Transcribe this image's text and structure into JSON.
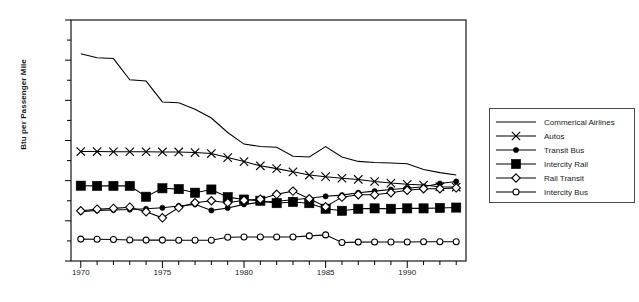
{
  "chart_data": {
    "type": "line",
    "title": "",
    "xlabel": "",
    "ylabel": "Btu per Passenger Mile",
    "xlim": [
      1969.4,
      1993.6
    ],
    "ylim": [
      0,
      12000
    ],
    "grid": false,
    "legend_position": "right",
    "x": [
      1970,
      1971,
      1972,
      1973,
      1974,
      1975,
      1976,
      1977,
      1978,
      1979,
      1980,
      1981,
      1982,
      1983,
      1984,
      1985,
      1986,
      1987,
      1988,
      1989,
      1990,
      1991,
      1992,
      1993
    ],
    "y_ticks": [
      0,
      2000,
      4000,
      6000,
      8000,
      10000,
      12000
    ],
    "y_tick_labels": [
      "0",
      "2,000",
      "4,000",
      "6,000",
      "8,000",
      "10,000",
      "12,000"
    ],
    "y_minor_ticks": [
      1000,
      3000,
      5000,
      7000,
      9000,
      11000
    ],
    "x_ticks": [
      1970,
      1971,
      1972,
      1973,
      1974,
      1975,
      1976,
      1977,
      1978,
      1979,
      1980,
      1981,
      1982,
      1983,
      1984,
      1985,
      1986,
      1987,
      1988,
      1989,
      1990,
      1991,
      1992,
      1993
    ],
    "x_tick_labels": [
      {
        "value": 1970,
        "label": "1970"
      },
      {
        "value": 1975,
        "label": "1975"
      },
      {
        "value": 1980,
        "label": "1980"
      },
      {
        "value": 1985,
        "label": "1985"
      },
      {
        "value": 1990,
        "label": "1990"
      }
    ],
    "series": [
      {
        "name": "Commerical Airlines",
        "marker": "none",
        "values": [
          10320,
          10120,
          10080,
          9020,
          8960,
          7920,
          7880,
          7560,
          7120,
          6400,
          5820,
          5700,
          5660,
          5220,
          5180,
          5700,
          5180,
          4960,
          4900,
          4880,
          4840,
          4560,
          4400,
          4280
        ]
      },
      {
        "name": "Autos",
        "marker": "x",
        "values": [
          5450,
          5450,
          5440,
          5440,
          5440,
          5430,
          5430,
          5400,
          5350,
          5150,
          4950,
          4740,
          4600,
          4440,
          4280,
          4200,
          4120,
          4060,
          3960,
          3880,
          3820,
          3780,
          3700,
          3680
        ]
      },
      {
        "name": "Transit Bus",
        "marker": "filled-circle",
        "values": [
          2450,
          2520,
          2540,
          2560,
          2600,
          2650,
          2740,
          2820,
          2520,
          2640,
          2820,
          2920,
          2980,
          3050,
          3120,
          3220,
          3280,
          3400,
          3480,
          3560,
          3620,
          3700,
          3860,
          3960
        ]
      },
      {
        "name": "Intercity Rail",
        "marker": "filled-square",
        "values": [
          3750,
          3740,
          3740,
          3740,
          3200,
          3620,
          3580,
          3400,
          3560,
          3180,
          3060,
          3000,
          2880,
          2940,
          2880,
          2600,
          2500,
          2600,
          2620,
          2600,
          2620,
          2620,
          2640,
          2660
        ]
      },
      {
        "name": "Rail Transit",
        "marker": "open-diamond",
        "values": [
          2500,
          2580,
          2620,
          2680,
          2450,
          2150,
          2660,
          2900,
          3000,
          2900,
          3020,
          3080,
          3320,
          3480,
          3100,
          2700,
          3180,
          3300,
          3300,
          3400,
          3520,
          3600,
          3600,
          3640
        ]
      },
      {
        "name": "Intercity Bus",
        "marker": "open-circle",
        "values": [
          1090,
          1080,
          1070,
          1050,
          1040,
          1040,
          1030,
          1030,
          1030,
          1180,
          1200,
          1200,
          1200,
          1200,
          1250,
          1300,
          920,
          940,
          950,
          950,
          950,
          960,
          960,
          960
        ]
      }
    ]
  },
  "legend": {
    "items": [
      {
        "label": "Commerical Airlines",
        "marker": "none"
      },
      {
        "label": "Autos",
        "marker": "x"
      },
      {
        "label": "Transit Bus",
        "marker": "filled-circle"
      },
      {
        "label": "Intercity Rail",
        "marker": "filled-square"
      },
      {
        "label": "Rail Transit",
        "marker": "open-diamond"
      },
      {
        "label": "Intercity Bus",
        "marker": "open-circle"
      }
    ]
  },
  "colors": {
    "line": "#000000",
    "frame": "#000000",
    "background": "#ffffff",
    "text": "#1a1a1a"
  }
}
